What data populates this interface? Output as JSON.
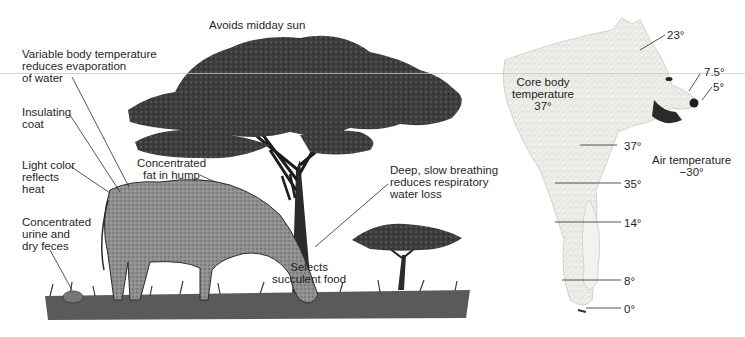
{
  "figure": {
    "left_panel": {
      "subject": "eland-in-savanna",
      "labels": {
        "avoids_sun": "Avoids midday sun",
        "variable_temp": [
          "Variable body temperature",
          "reduces evaporation",
          "of water"
        ],
        "insulating_coat": [
          "Insulating",
          "coat"
        ],
        "light_color": [
          "Light color",
          "reflects",
          "heat"
        ],
        "fat_hump": [
          "Concentrated",
          "fat in hump"
        ],
        "urine_feces": [
          "Concentrated",
          "urine and",
          "dry feces"
        ],
        "breathing": [
          "Deep, slow breathing",
          "reduces respiratory",
          "water loss"
        ],
        "succulent_food": [
          "Selects",
          "succulent food"
        ]
      }
    },
    "right_panel": {
      "subject": "arctic-wolf",
      "core_label": [
        "Core body",
        "temperature",
        "37°"
      ],
      "air_label": [
        "Air temperature",
        "−30°"
      ],
      "temperatures": {
        "head": "23°",
        "muzzle": "7.5°",
        "nose": "5°",
        "chest": "37°",
        "upper_leg": "35°",
        "mid_leg": "14°",
        "lower_leg": "8°",
        "paw": "0°"
      }
    },
    "colors": {
      "ink": "#1f1f1f",
      "foliage": "#3a3a3a",
      "eland_fill": "#8e8e8e",
      "wolf_fill": "#eeeeea",
      "grass": "#4a4a4a"
    }
  }
}
